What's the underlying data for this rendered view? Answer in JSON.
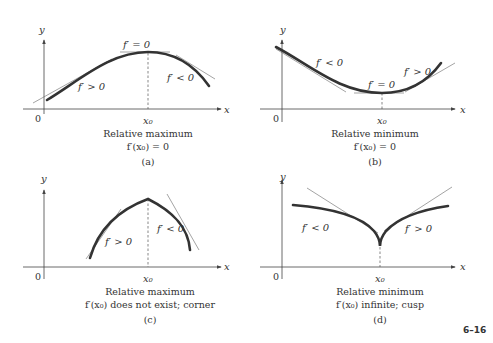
{
  "figure_number": "6–16",
  "panels": [
    {
      "id": "a",
      "axis_x_label": "x",
      "axis_y_label": "y",
      "origin_label": "0",
      "x0_label": "x₀",
      "annotations": [
        "f′ = 0",
        "f′ > 0",
        "f′ < 0"
      ],
      "title": "Relative maximum",
      "condition": "f′(x₀) = 0",
      "tag": "(a)"
    },
    {
      "id": "b",
      "axis_x_label": "x",
      "axis_y_label": "y",
      "origin_label": "0",
      "x0_label": "x₀",
      "annotations": [
        "f′ < 0",
        "f′ = 0",
        "f′ > 0"
      ],
      "title": "Relative minimum",
      "condition": "f′(x₀) = 0",
      "tag": "(b)"
    },
    {
      "id": "c",
      "axis_x_label": "x",
      "axis_y_label": "y",
      "origin_label": "0",
      "x0_label": "x₀",
      "annotations": [
        "f′ > 0",
        "f′ < 0"
      ],
      "title": "Relative maximum",
      "condition": "f′(x₀) does not exist; corner",
      "tag": "(c)"
    },
    {
      "id": "d",
      "axis_x_label": "x",
      "axis_y_label": "y",
      "origin_label": "0",
      "x0_label": "x₀",
      "annotations": [
        "f′ < 0",
        "f′ > 0"
      ],
      "title": "Relative minimum",
      "condition": "f′(x₀) infinite; cusp",
      "tag": "(d)"
    }
  ]
}
